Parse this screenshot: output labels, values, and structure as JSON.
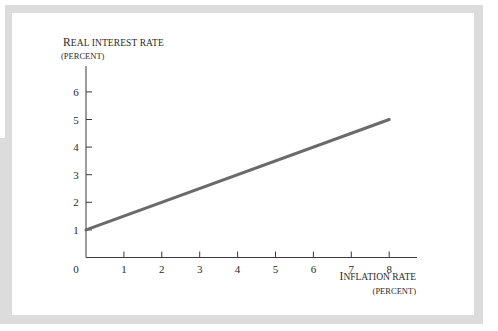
{
  "chart_data": {
    "type": "line",
    "title": "",
    "xlabel": "Inflation rate (percent)",
    "ylabel": "Real interest rate (percent)",
    "x_ticks": [
      "1",
      "2",
      "3",
      "4",
      "5",
      "6",
      "7",
      "8"
    ],
    "y_ticks": [
      "1",
      "2",
      "3",
      "4",
      "5",
      "6"
    ],
    "origin_label": "0",
    "xlim": [
      0,
      9
    ],
    "ylim": [
      0,
      6.9
    ],
    "grid": false,
    "legend": null,
    "series": [
      {
        "name": "Real interest rate",
        "x": [
          0,
          8
        ],
        "y": [
          1,
          5
        ],
        "color": "#6a6a6a"
      }
    ]
  },
  "labels": {
    "y_axis_line1_cap": "R",
    "y_axis_line1_rest": "EAL INTEREST RATE",
    "y_axis_line2": "(PERCENT)",
    "x_axis_line1_cap": "I",
    "x_axis_line1_rest": "NFLATION RATE",
    "x_axis_line2": "(PERCENT)"
  },
  "colors": {
    "frame": "#dcdcdc",
    "axis": "#3a3a3a",
    "series": "#6a6a6a",
    "text": "#2a2a2a"
  }
}
